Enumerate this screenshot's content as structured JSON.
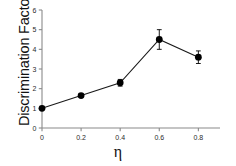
{
  "chart_data": {
    "type": "line",
    "title": "",
    "subtitle": "",
    "xlabel": "η",
    "ylabel": "Discrimination Factor",
    "x": [
      0,
      0.2,
      0.4,
      0.6,
      0.8
    ],
    "values": [
      1.0,
      1.65,
      2.3,
      4.5,
      3.6
    ],
    "yerr": [
      0.05,
      0.08,
      0.17,
      0.5,
      0.32
    ],
    "series": [
      {
        "name": "Discrimination Factor",
        "values": [
          1.0,
          1.65,
          2.3,
          4.5,
          3.6
        ],
        "yerr": [
          0.05,
          0.08,
          0.17,
          0.5,
          0.32
        ]
      }
    ],
    "xlim": [
      0,
      0.88
    ],
    "ylim": [
      0,
      6
    ],
    "xticks": [
      0,
      0.2,
      0.4,
      0.6,
      0.8
    ],
    "xtick_labels": [
      "0",
      "0.2",
      "0.4",
      "0.6",
      "0.8"
    ],
    "yticks": [
      0,
      1,
      2,
      3,
      4,
      5,
      6
    ],
    "ytick_labels": [
      "0",
      "1",
      "2",
      "3",
      "4",
      "5",
      "6"
    ],
    "grid": false,
    "legend": null,
    "marker": "circle",
    "marker_color": "#000000",
    "line_color": "#1a1a1a",
    "axis_color": "#8a8a8a",
    "background": "#ffffff"
  },
  "axes": {
    "y_axis_label": "Discrimination Factor",
    "x_axis_label": "η"
  }
}
